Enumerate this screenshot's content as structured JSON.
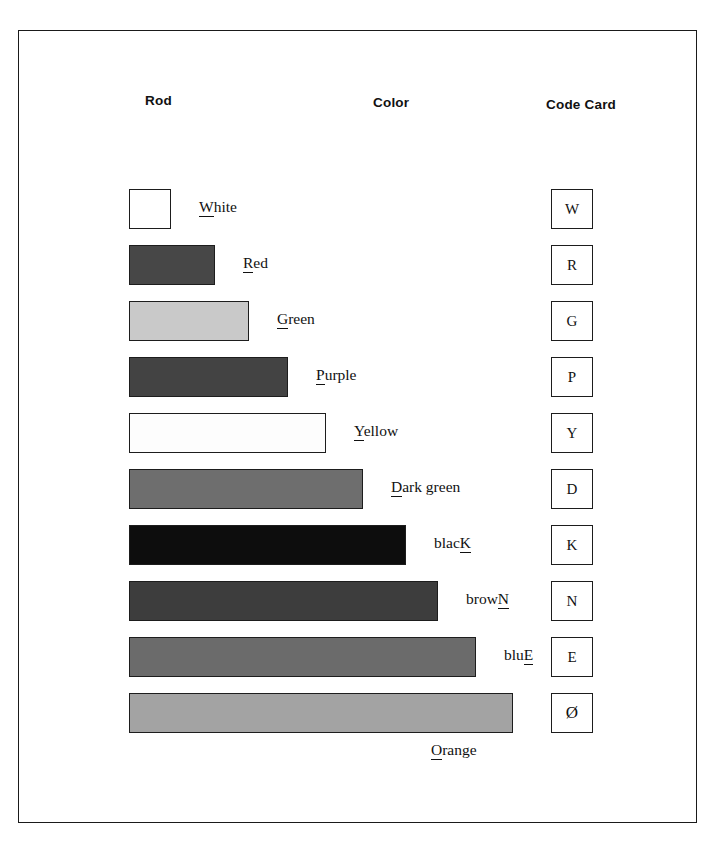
{
  "page": {
    "frame_color": "#1a1a1a",
    "background": "#ffffff"
  },
  "headers": {
    "rod": "Rod",
    "color": "Color",
    "code_card": "Code Card"
  },
  "chart_data": {
    "type": "bar",
    "xlabel": "",
    "ylabel": "",
    "orientation": "horizontal",
    "unit_length_px": 38,
    "categories": [
      "White",
      "Red",
      "Green",
      "Purple",
      "Yellow",
      "Dark green",
      "blacK",
      "browN",
      "bluE",
      "Orange"
    ],
    "values": [
      1,
      2,
      3,
      4,
      5,
      6,
      7,
      8,
      9,
      10
    ],
    "bar_widths_px": [
      42,
      86,
      120,
      159,
      197,
      234,
      277,
      309,
      347,
      384
    ],
    "fill_colors": [
      "#ffffff",
      "#474747",
      "#c9c9c9",
      "#434343",
      "#fdfdfd",
      "#6e6e6e",
      "#0d0d0d",
      "#3d3d3d",
      "#6b6b6b",
      "#a3a3a3"
    ],
    "code_letters": [
      "W",
      "R",
      "G",
      "P",
      "Y",
      "D",
      "K",
      "N",
      "E",
      "Ø"
    ]
  },
  "rows": [
    {
      "name": "white",
      "label_prefix": "",
      "label_key": "W",
      "label_suffix": "hite",
      "label_full": "White",
      "fill": "#ffffff",
      "width": 42,
      "label_below": false,
      "card": "W",
      "card_slashed": false
    },
    {
      "name": "red",
      "label_prefix": "",
      "label_key": "R",
      "label_suffix": "ed",
      "label_full": "Red",
      "fill": "#474747",
      "width": 86,
      "label_below": false,
      "card": "R",
      "card_slashed": false
    },
    {
      "name": "green",
      "label_prefix": "",
      "label_key": "G",
      "label_suffix": "reen",
      "label_full": "Green",
      "fill": "#c9c9c9",
      "width": 120,
      "label_below": false,
      "card": "G",
      "card_slashed": false
    },
    {
      "name": "purple",
      "label_prefix": "",
      "label_key": "P",
      "label_suffix": "urple",
      "label_full": "Purple",
      "fill": "#434343",
      "width": 159,
      "label_below": false,
      "card": "P",
      "card_slashed": false
    },
    {
      "name": "yellow",
      "label_prefix": "",
      "label_key": "Y",
      "label_suffix": "ellow",
      "label_full": "Yellow",
      "fill": "#fdfdfd",
      "width": 197,
      "label_below": false,
      "card": "Y",
      "card_slashed": false
    },
    {
      "name": "dark-green",
      "label_prefix": "",
      "label_key": "D",
      "label_suffix": "ark green",
      "label_full": "Dark green",
      "fill": "#6e6e6e",
      "width": 234,
      "label_below": false,
      "card": "D",
      "card_slashed": false
    },
    {
      "name": "black",
      "label_prefix": "blac",
      "label_key": "K",
      "label_suffix": "",
      "label_full": "blacK",
      "fill": "#0d0d0d",
      "width": 277,
      "label_below": false,
      "card": "K",
      "card_slashed": false
    },
    {
      "name": "brown",
      "label_prefix": "brow",
      "label_key": "N",
      "label_suffix": "",
      "label_full": "browN",
      "fill": "#3d3d3d",
      "width": 309,
      "label_below": false,
      "card": "N",
      "card_slashed": false
    },
    {
      "name": "blue",
      "label_prefix": "blu",
      "label_key": "E",
      "label_suffix": "",
      "label_full": "bluE",
      "fill": "#6b6b6b",
      "width": 347,
      "label_below": false,
      "card": "E",
      "card_slashed": false
    },
    {
      "name": "orange",
      "label_prefix": "",
      "label_key": "O",
      "label_suffix": "range",
      "label_full": "Orange",
      "fill": "#a3a3a3",
      "width": 384,
      "label_below": true,
      "card": "Ø",
      "card_slashed": true
    }
  ],
  "layout": {
    "bar_left_px": 128,
    "row_tops_px": [
      188,
      244,
      300,
      356,
      412,
      468,
      524,
      580,
      636,
      692
    ],
    "label_gap_px": 28,
    "card_left_px": 550
  }
}
